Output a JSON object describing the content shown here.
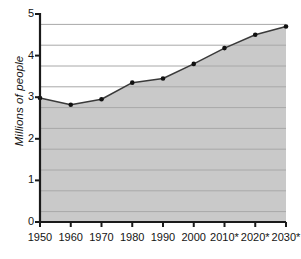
{
  "chart_data": {
    "type": "area",
    "title": "",
    "subtitle": "",
    "xlabel": "",
    "ylabel": "Millions of people",
    "categories": [
      "1950",
      "1960",
      "1970",
      "1980",
      "1990",
      "2000",
      "2010*",
      "2020*",
      "2030*"
    ],
    "values": [
      2.98,
      2.82,
      2.95,
      3.35,
      3.45,
      3.8,
      4.18,
      4.5,
      4.7
    ],
    "x_tick_labels": [
      "1950",
      "1960",
      "1970",
      "1980",
      "1990",
      "2000",
      "2010*",
      "2020*",
      "2030*"
    ],
    "y_tick_labels": [
      "0",
      "1",
      "2",
      "3",
      "4",
      "5"
    ],
    "y_tick_values": [
      0,
      1,
      2,
      3,
      4,
      5
    ],
    "ylim": [
      0,
      5
    ],
    "grid": true,
    "grid_axis": "y",
    "grid_interval": 0.5,
    "grid_values": [
      0.25,
      0.75,
      1.25,
      1.75,
      2.25,
      2.75,
      3.25,
      3.75,
      4.25,
      4.75
    ],
    "legend": null,
    "legend_position": "none",
    "annotations": [
      "* projected values indicated by asterisk"
    ],
    "colors": {
      "area_fill": "#c9c9c9",
      "area_fill_above_line": "#ffffff",
      "line": "#3a3a3a",
      "marker": "#111111",
      "gridline": "#a8a8a8",
      "axis": "#1a1a1a",
      "background": "#ffffff",
      "text": "#141414"
    },
    "series": [
      {
        "name": "Population",
        "values": [
          2.98,
          2.82,
          2.95,
          3.35,
          3.45,
          3.8,
          4.18,
          4.5,
          4.7
        ]
      }
    ],
    "points": [
      {
        "x": "1950",
        "y": 2.98
      },
      {
        "x": "1960",
        "y": 2.82
      },
      {
        "x": "1970",
        "y": 2.95
      },
      {
        "x": "1980",
        "y": 3.35
      },
      {
        "x": "1990",
        "y": 3.45
      },
      {
        "x": "2000",
        "y": 3.8
      },
      {
        "x": "2010*",
        "y": 4.18
      },
      {
        "x": "2020*",
        "y": 4.5
      },
      {
        "x": "2030*",
        "y": 4.7
      }
    ]
  }
}
